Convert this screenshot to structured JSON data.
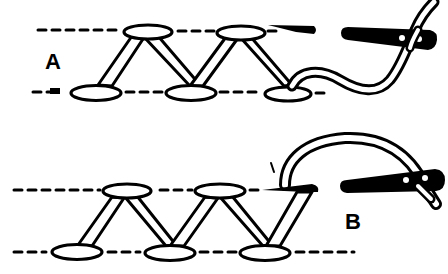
{
  "figure": {
    "colors": {
      "ink": "#000000",
      "paper": "#ffffff"
    },
    "panels": [
      {
        "id": "A",
        "label": "A",
        "description": "thread pulled through after forming zigzag; needle eye to the right"
      },
      {
        "id": "B",
        "label": "B",
        "description": "thread looped over, needle inserted at upper guideline"
      }
    ]
  }
}
